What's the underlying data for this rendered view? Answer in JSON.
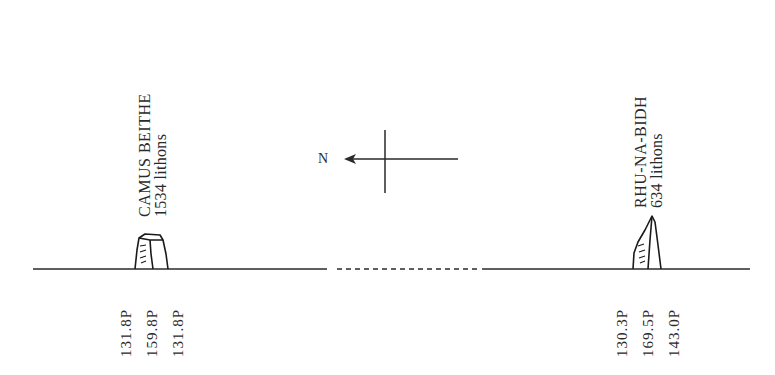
{
  "sites": [
    {
      "name": "CAMUS BEITHE",
      "count": "1534 lithons",
      "measurements": [
        "131.8P",
        "159.8P",
        "131.8P"
      ]
    },
    {
      "name": "RHU-NA-BIDH",
      "count": "634 lithons",
      "measurements": [
        "130.3P",
        "169.5P",
        "143.0P"
      ]
    }
  ],
  "compass": {
    "label": "N",
    "direction": "left"
  },
  "colors": {
    "ink": "#2a2a2a",
    "background": "#ffffff"
  }
}
